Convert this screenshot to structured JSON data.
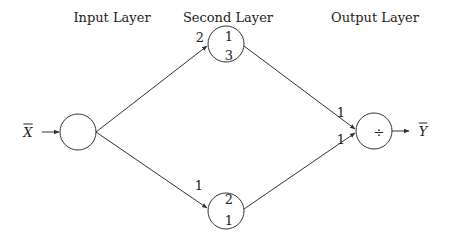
{
  "headers": {
    "input": "Input Layer",
    "second": "Second Layer",
    "output": "Output Layer"
  },
  "io": {
    "input_symbol": "X",
    "output_symbol": "Y"
  },
  "nodes": {
    "input": {
      "label": ""
    },
    "second_top": {
      "top": "1",
      "bottom": "3"
    },
    "second_bottom": {
      "top": "2",
      "bottom": "1"
    },
    "output": {
      "label": "÷"
    }
  },
  "weights": {
    "input_to_top": "2",
    "input_to_bottom": "1",
    "top_to_output": "1",
    "bottom_to_output": "1"
  },
  "colors": {
    "stroke": "#333333",
    "background": "#ffffff"
  }
}
